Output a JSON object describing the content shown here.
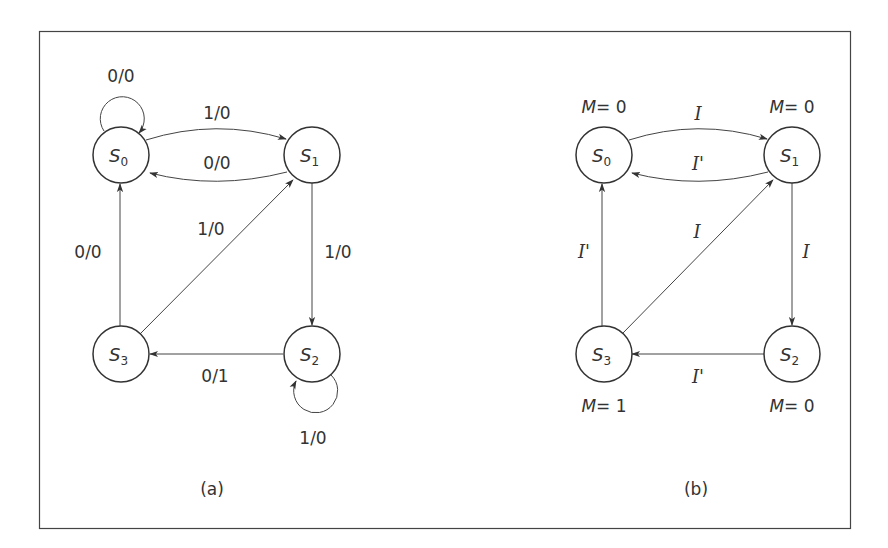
{
  "figure": {
    "panels": [
      {
        "caption": "(a)",
        "type": "Mealy state diagram",
        "states": [
          {
            "name": "S",
            "sub": "0"
          },
          {
            "name": "S",
            "sub": "1"
          },
          {
            "name": "S",
            "sub": "2"
          },
          {
            "name": "S",
            "sub": "3"
          }
        ],
        "transitions": [
          {
            "from": "S0",
            "to": "S0",
            "label": "0/0"
          },
          {
            "from": "S0",
            "to": "S1",
            "label": "1/0"
          },
          {
            "from": "S1",
            "to": "S0",
            "label": "0/0"
          },
          {
            "from": "S1",
            "to": "S2",
            "label": "1/0"
          },
          {
            "from": "S2",
            "to": "S2",
            "label": "1/0"
          },
          {
            "from": "S2",
            "to": "S3",
            "label": "0/1"
          },
          {
            "from": "S3",
            "to": "S0",
            "label": "0/0"
          },
          {
            "from": "S3",
            "to": "S1",
            "label": "1/0"
          }
        ]
      },
      {
        "caption": "(b)",
        "type": "Moore state diagram",
        "states": [
          {
            "name": "S",
            "sub": "0",
            "output_var": "M",
            "output_eq": "= 0"
          },
          {
            "name": "S",
            "sub": "1",
            "output_var": "M",
            "output_eq": "= 0"
          },
          {
            "name": "S",
            "sub": "2",
            "output_var": "M",
            "output_eq": "= 0"
          },
          {
            "name": "S",
            "sub": "3",
            "output_var": "M",
            "output_eq": "= 1"
          }
        ],
        "transitions": [
          {
            "from": "S0",
            "to": "S1",
            "label": "I"
          },
          {
            "from": "S1",
            "to": "S0",
            "label": "I'"
          },
          {
            "from": "S1",
            "to": "S2",
            "label": "I"
          },
          {
            "from": "S2",
            "to": "S3",
            "label": "I'"
          },
          {
            "from": "S3",
            "to": "S0",
            "label": "I'"
          },
          {
            "from": "S3",
            "to": "S1",
            "label": "I"
          }
        ]
      }
    ]
  }
}
